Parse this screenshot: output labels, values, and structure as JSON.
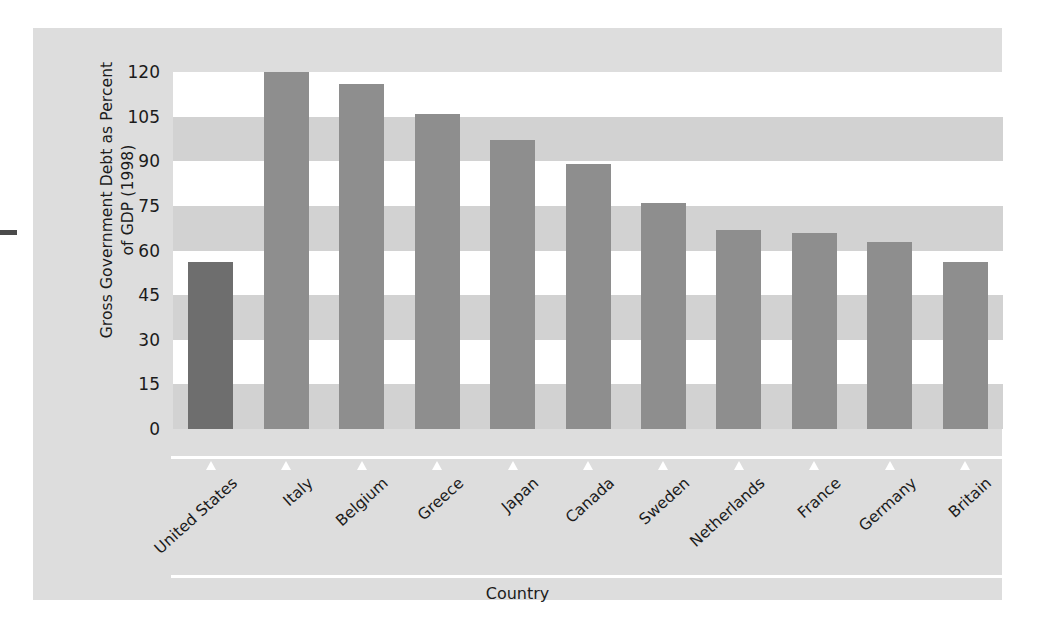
{
  "chart_data": {
    "type": "bar",
    "title": "",
    "xlabel": "Country",
    "ylabel": "Gross Government Debt as Percent of GDP (1998)",
    "ylabel_line1": "Gross Government Debt as Percent",
    "ylabel_line2": "of GDP (1998)",
    "categories": [
      "United States",
      "Italy",
      "Belgium",
      "Greece",
      "Japan",
      "Canada",
      "Sweden",
      "Netherlands",
      "France",
      "Germany",
      "Britain"
    ],
    "values": [
      56,
      120,
      116,
      106,
      97,
      89,
      76,
      67,
      66,
      63,
      56
    ],
    "ylim": [
      0,
      120
    ],
    "yticks": [
      0,
      15,
      30,
      45,
      60,
      75,
      90,
      105,
      120
    ],
    "ytick_labels": [
      "0",
      "15",
      "30",
      "45",
      "60",
      "75",
      "90",
      "105",
      "120"
    ],
    "grid": "horizontal-banded",
    "legend": "none",
    "highlight_index": 0,
    "colors": {
      "bar": "#8e8e8e",
      "bar_highlight": "#6e6e6e",
      "panel_background": "#dddddd",
      "band_light": "#ffffff",
      "band_dark": "#d2d2d2",
      "text": "#1b1b1b",
      "axis_line": "#ffffff"
    }
  }
}
